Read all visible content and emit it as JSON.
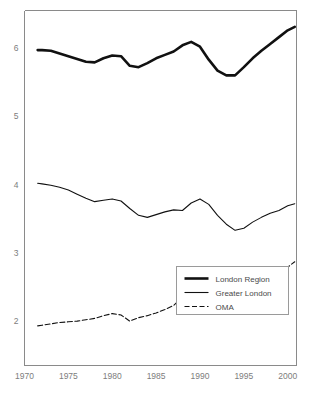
{
  "chart_data": {
    "type": "line",
    "title": "",
    "subtitle": "",
    "xlabel": "",
    "ylabel": "",
    "xlim": [
      1970,
      2001
    ],
    "ylim": [
      1.35,
      6.55
    ],
    "grid": false,
    "legend_position": "bottom-right",
    "xticks": [
      1970,
      1975,
      1980,
      1985,
      1990,
      1995,
      2000
    ],
    "xtick_labels": [
      "1970",
      "1975",
      "1980",
      "1985",
      "1990",
      "1995",
      "2000"
    ],
    "yticks": [
      2,
      3,
      4,
      5,
      6
    ],
    "ytick_labels": [
      "2",
      "3",
      "4",
      "5",
      "6"
    ],
    "x": [
      1971.5,
      1972,
      1973,
      1974,
      1975,
      1976,
      1977,
      1978,
      1979,
      1980,
      1981,
      1982,
      1983,
      1984,
      1985,
      1986,
      1987,
      1988,
      1989,
      1990,
      1991,
      1992,
      1993,
      1994,
      1995,
      1996,
      1997,
      1998,
      1999,
      2000,
      2000.8
    ],
    "series": [
      {
        "name": "London Region",
        "style": "solid-thick",
        "stroke_width": 2.6,
        "dash": "",
        "color": "#111111",
        "values": [
          5.97,
          5.97,
          5.96,
          5.92,
          5.88,
          5.84,
          5.8,
          5.79,
          5.85,
          5.89,
          5.88,
          5.74,
          5.72,
          5.78,
          5.85,
          5.9,
          5.95,
          6.04,
          6.09,
          6.02,
          5.83,
          5.67,
          5.6,
          5.6,
          5.72,
          5.85,
          5.96,
          6.06,
          6.16,
          6.26,
          6.31
        ]
      },
      {
        "name": "Greater London",
        "style": "solid-thin",
        "stroke_width": 1.1,
        "dash": "",
        "color": "#111111",
        "values": [
          4.02,
          4.01,
          3.99,
          3.96,
          3.92,
          3.86,
          3.8,
          3.75,
          3.77,
          3.79,
          3.76,
          3.65,
          3.55,
          3.52,
          3.56,
          3.6,
          3.63,
          3.62,
          3.73,
          3.79,
          3.71,
          3.55,
          3.42,
          3.33,
          3.36,
          3.45,
          3.52,
          3.58,
          3.62,
          3.69,
          3.72
        ]
      },
      {
        "name": "OMA",
        "style": "dashed",
        "stroke_width": 1.1,
        "dash": "5 2.5",
        "color": "#111111",
        "values": [
          1.93,
          1.94,
          1.96,
          1.98,
          1.99,
          2.0,
          2.02,
          2.04,
          2.08,
          2.11,
          2.09,
          2.0,
          2.05,
          2.08,
          2.12,
          2.17,
          2.23,
          2.35,
          2.43,
          2.41,
          2.29,
          2.2,
          2.19,
          2.2,
          2.3,
          2.38,
          2.46,
          2.56,
          2.66,
          2.79,
          2.87
        ]
      }
    ],
    "legend": [
      {
        "label": "London Region",
        "swatch": "solid-thick"
      },
      {
        "label": "Greater London",
        "swatch": "solid-thin"
      },
      {
        "label": "OMA",
        "swatch": "dashed"
      }
    ]
  }
}
